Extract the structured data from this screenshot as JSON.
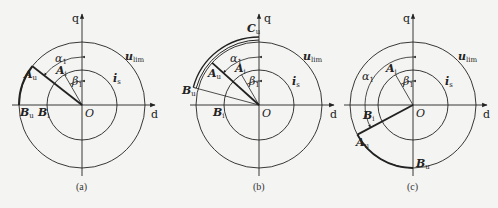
{
  "panels": [
    {
      "id": "a",
      "caption": "(a)",
      "axes": {
        "d": "d",
        "q": "q",
        "origin": "O"
      },
      "circles": {
        "outer": "u",
        "outer_sub": "lim",
        "inner": "i",
        "inner_sub": "s"
      },
      "points": {
        "Au": "A",
        "Au_sub": "u",
        "Ai": "A",
        "Ai_sub": "i",
        "Bu": "B",
        "Bu_sub": "u",
        "Bi": "B",
        "Bi_sub": "i"
      },
      "angles": {
        "alpha": "α",
        "alpha_sub": "1",
        "beta": "β",
        "beta_sub": "1"
      }
    },
    {
      "id": "b",
      "caption": "(b)",
      "axes": {
        "d": "d",
        "q": "q",
        "origin": "O"
      },
      "circles": {
        "outer": "u",
        "outer_sub": "lim",
        "inner": "i",
        "inner_sub": "s"
      },
      "points": {
        "Cu": "C",
        "Cu_sub": "u",
        "Au": "A",
        "Au_sub": "u",
        "Ai": "A",
        "Ai_sub": "i",
        "Bu": "B",
        "Bu_sub": "u",
        "Bi": "B",
        "Bi_sub": "i"
      },
      "angles": {
        "alpha": "α",
        "alpha_sub": "1",
        "beta": "β",
        "beta_sub": "1"
      }
    },
    {
      "id": "c",
      "caption": "(c)",
      "axes": {
        "d": "d",
        "q": "q",
        "origin": "O"
      },
      "circles": {
        "outer": "u",
        "outer_sub": "lim",
        "inner": "i",
        "inner_sub": "s"
      },
      "points": {
        "Au": "A",
        "Au_sub": "u",
        "Ai": "A",
        "Ai_sub": "i",
        "Bu": "B",
        "Bu_sub": "u",
        "Bi": "B",
        "Bi_sub": "i"
      },
      "angles": {
        "alpha": "α",
        "alpha_sub": "1",
        "beta": "β",
        "beta_sub": "1"
      }
    }
  ],
  "colors": {
    "ink": "#222222",
    "background": "#f4f4f2"
  }
}
